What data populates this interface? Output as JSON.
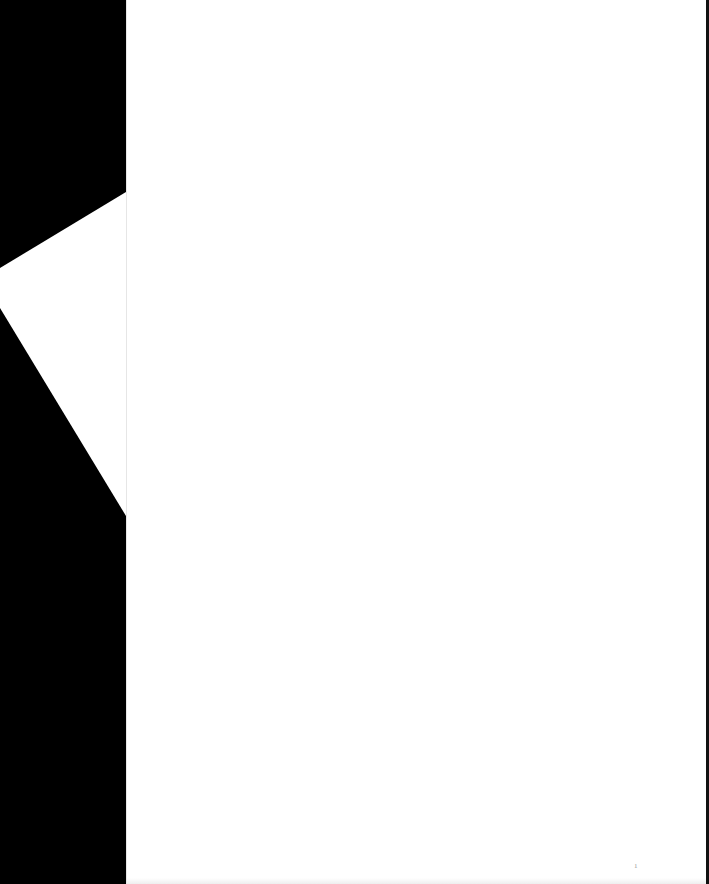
{
  "document": {
    "type": "scanned blank page",
    "page_mark": "1"
  },
  "colors": {
    "background": "#000000",
    "page": "#ffffff"
  }
}
